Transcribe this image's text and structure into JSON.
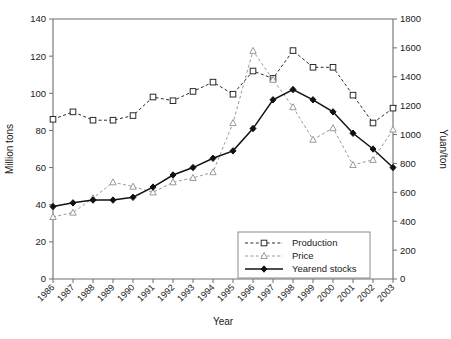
{
  "chart_data": {
    "type": "line",
    "title": "",
    "xlabel": "Year",
    "ylabel": "Million tons",
    "y2label": "Yuan/ton",
    "grid": false,
    "legend_position": "bottom-right",
    "categories": [
      "1986",
      "1987",
      "1988",
      "1989",
      "1990",
      "1991",
      "1992",
      "1993",
      "1994",
      "1995",
      "1996",
      "1997",
      "1998",
      "1999",
      "2000",
      "2001",
      "2002",
      "2003"
    ],
    "x": [
      1986,
      1987,
      1988,
      1989,
      1990,
      1991,
      1992,
      1993,
      1994,
      1995,
      1996,
      1997,
      1998,
      1999,
      2000,
      2001,
      2002,
      2003
    ],
    "ylim": [
      0,
      140
    ],
    "y2lim": [
      0,
      1800
    ],
    "yticks": [
      0,
      20,
      40,
      60,
      80,
      100,
      120,
      140
    ],
    "y2ticks": [
      0,
      200,
      400,
      600,
      800,
      1000,
      1200,
      1400,
      1600,
      1800
    ],
    "series": [
      {
        "name": "Production",
        "axis": "left",
        "units": "Million tons",
        "marker": "open-square",
        "linestyle": "dashed",
        "color": "#2b2b2b",
        "values": [
          86,
          90,
          85.5,
          85.5,
          88,
          98,
          96,
          101,
          106,
          99.5,
          112,
          108,
          123,
          114,
          114,
          99,
          84,
          92
        ]
      },
      {
        "name": "Price",
        "axis": "right",
        "units": "Yuan/ton",
        "marker": "open-triangle",
        "linestyle": "dashed",
        "color": "#9a9a9a",
        "values": [
          430,
          460,
          560,
          670,
          640,
          600,
          670,
          700,
          740,
          1080,
          1580,
          1380,
          1190,
          965,
          1045,
          790,
          825,
          1035
        ]
      },
      {
        "name": "Yearend stocks",
        "axis": "left",
        "units": "Million tons",
        "marker": "filled-diamond",
        "linestyle": "solid",
        "color": "#111111",
        "values": [
          39,
          41,
          42.5,
          42.5,
          44,
          49.5,
          56,
          60,
          65,
          69,
          81,
          96.5,
          102,
          96.5,
          90,
          78.5,
          70,
          60
        ]
      }
    ]
  },
  "legend": {
    "entries": [
      {
        "label": "Production"
      },
      {
        "label": "Price"
      },
      {
        "label": "Yearend stocks"
      }
    ]
  },
  "axes": {
    "left_title": "Million tons",
    "right_title": "Yuan/ton",
    "bottom_title": "Year"
  }
}
